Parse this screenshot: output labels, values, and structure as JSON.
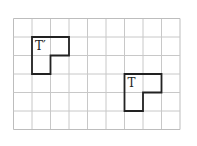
{
  "diagram": {
    "grid": {
      "columns": 9,
      "rows": 6,
      "cell_size": 18.5,
      "line_color": "#c8c8c8",
      "border_color": "#bdbdbd"
    },
    "shapes": [
      {
        "id": "t-prime",
        "label": "T′",
        "origin_col": 1,
        "origin_row": 1,
        "stroke": "#222222"
      },
      {
        "id": "t",
        "label": "T",
        "origin_col": 6,
        "origin_row": 3,
        "stroke": "#222222"
      }
    ]
  }
}
